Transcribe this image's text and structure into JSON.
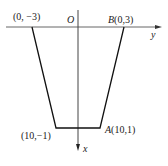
{
  "diagram": {
    "axes": {
      "origin_label": "O",
      "horizontal_axis_label": "y",
      "vertical_axis_label": "x"
    },
    "points": [
      {
        "name": "",
        "coords": "(0, −3)",
        "text": "(0, −3)"
      },
      {
        "name": "B",
        "coords": "(0,3)",
        "text": "(0,3)"
      },
      {
        "name": "",
        "coords": "(10,−1)",
        "text": "(10,−1)"
      },
      {
        "name": "A",
        "coords": "(10,1)",
        "text": "(10,1)"
      }
    ],
    "colors": {
      "line": "#111111",
      "axis": "#555555",
      "background": "#ffffff"
    }
  }
}
